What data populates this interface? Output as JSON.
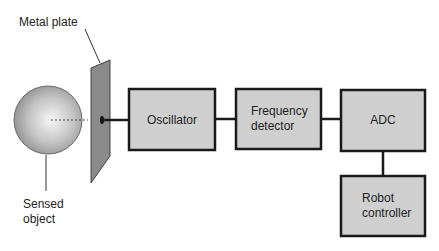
{
  "diagram": {
    "labels": {
      "metal_plate": "Metal plate",
      "sensed_object_line1": "Sensed",
      "sensed_object_line2": "object"
    },
    "blocks": [
      {
        "id": "oscillator",
        "lines": [
          "Oscillator"
        ]
      },
      {
        "id": "frequency-detector",
        "lines": [
          "Frequency",
          "detector"
        ]
      },
      {
        "id": "adc",
        "lines": [
          "ADC"
        ]
      },
      {
        "id": "robot-controller",
        "lines": [
          "Robot",
          "controller"
        ]
      }
    ],
    "connections": [
      [
        "metal-plate",
        "oscillator"
      ],
      [
        "oscillator",
        "frequency-detector"
      ],
      [
        "frequency-detector",
        "adc"
      ],
      [
        "adc",
        "robot-controller"
      ]
    ],
    "colors": {
      "block_fill": "#cfcfcf",
      "block_stroke": "#1a1a1a",
      "plate_fill": "#8a8a8a",
      "sphere_light": "#f4f4f4",
      "sphere_dark": "#8c8c8c"
    }
  }
}
